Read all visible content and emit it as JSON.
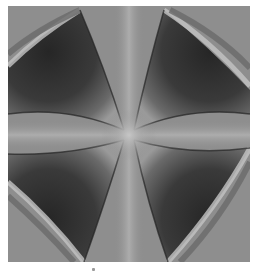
{
  "figure": {
    "background_color": "#8e8e8e",
    "lobe_dark_color": "#2e2e2e",
    "lobe_mid_color": "#5a5a5a",
    "rim_light_color": "#c4c4c4",
    "center_glow_color": "#b8b8b8"
  }
}
